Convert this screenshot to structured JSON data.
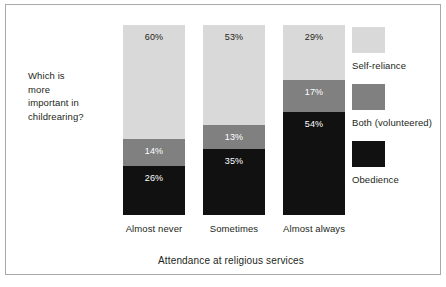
{
  "question": {
    "lines": [
      "Which is",
      "more",
      "important in",
      "childrearing?"
    ]
  },
  "chart_data": {
    "type": "bar",
    "subtype": "100% stacked column",
    "title": "",
    "xlabel": "Attendance at religious services",
    "ylabel": "",
    "ylim": [
      0,
      100
    ],
    "grid": false,
    "legend_position": "right",
    "categories": [
      "Almost never",
      "Sometimes",
      "Almost always"
    ],
    "series": [
      {
        "name": "Self-reliance",
        "color": "#d9d9d9",
        "values": [
          60,
          53,
          29
        ],
        "labels": [
          "60%",
          "53%",
          "29%"
        ]
      },
      {
        "name": "Both (volunteered)",
        "color": "#808080",
        "values": [
          14,
          13,
          17
        ],
        "labels": [
          "14%",
          "13%",
          "17%"
        ]
      },
      {
        "name": "Obedience",
        "color": "#111111",
        "values": [
          26,
          35,
          54
        ],
        "labels": [
          "26%",
          "35%",
          "54%"
        ]
      }
    ]
  },
  "legend": {
    "items": [
      {
        "label": "Self-reliance"
      },
      {
        "label": "Both (volunteered)"
      },
      {
        "label": "Obedience"
      }
    ]
  },
  "colors": {
    "self_reliance": "#d9d9d9",
    "both": "#808080",
    "obedience": "#111111",
    "frame": "#a9a9ad",
    "text": "#231f20"
  }
}
